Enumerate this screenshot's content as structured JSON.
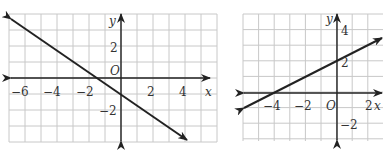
{
  "graphs": [
    {
      "id": "left",
      "x_ticks": [
        {
          "label": "−6",
          "x": -6
        },
        {
          "label": "−4",
          "x": -4
        },
        {
          "label": "−2",
          "x": -2
        },
        {
          "label": "2",
          "x": 2
        },
        {
          "label": "4",
          "x": 4
        }
      ],
      "y_ticks": [
        {
          "label": "2",
          "y": 2
        },
        {
          "label": "−2",
          "y": -2
        }
      ],
      "x_axis_label": "x",
      "y_axis_label": "y",
      "origin_label": "O",
      "line": {
        "slope": -0.6667,
        "intercept": -1,
        "points": [
          [
            -7,
            3.67
          ],
          [
            4,
            -3.67
          ]
        ]
      }
    },
    {
      "id": "right",
      "x_ticks": [
        {
          "label": "−4",
          "x": -4
        },
        {
          "label": "−2",
          "x": -2
        },
        {
          "label": "2",
          "x": 2
        }
      ],
      "y_ticks": [
        {
          "label": "4",
          "y": 4
        },
        {
          "label": "2",
          "y": 2
        },
        {
          "label": "−2",
          "y": -2
        }
      ],
      "x_axis_label": "x",
      "y_axis_label": "y",
      "origin_label": "O",
      "line": {
        "slope": 0.5,
        "intercept": 2,
        "points": [
          [
            -6,
            -1
          ],
          [
            3,
            3.5
          ]
        ]
      }
    }
  ],
  "chart_data": [
    {
      "type": "line",
      "title": "",
      "xlabel": "x",
      "ylabel": "y",
      "xlim": [
        -7,
        5
      ],
      "ylim": [
        -4,
        4
      ],
      "grid": true,
      "series": [
        {
          "name": "line",
          "x": [
            -7,
            -1.5,
            0,
            4
          ],
          "values": [
            3.67,
            0,
            -1,
            -3.67
          ]
        }
      ]
    },
    {
      "type": "line",
      "title": "",
      "xlabel": "x",
      "ylabel": "y",
      "xlim": [
        -6,
        3
      ],
      "ylim": [
        -3,
        5
      ],
      "grid": true,
      "series": [
        {
          "name": "line",
          "x": [
            -6,
            -4,
            0,
            3
          ],
          "values": [
            -1,
            0,
            2,
            3.5
          ]
        }
      ]
    }
  ]
}
